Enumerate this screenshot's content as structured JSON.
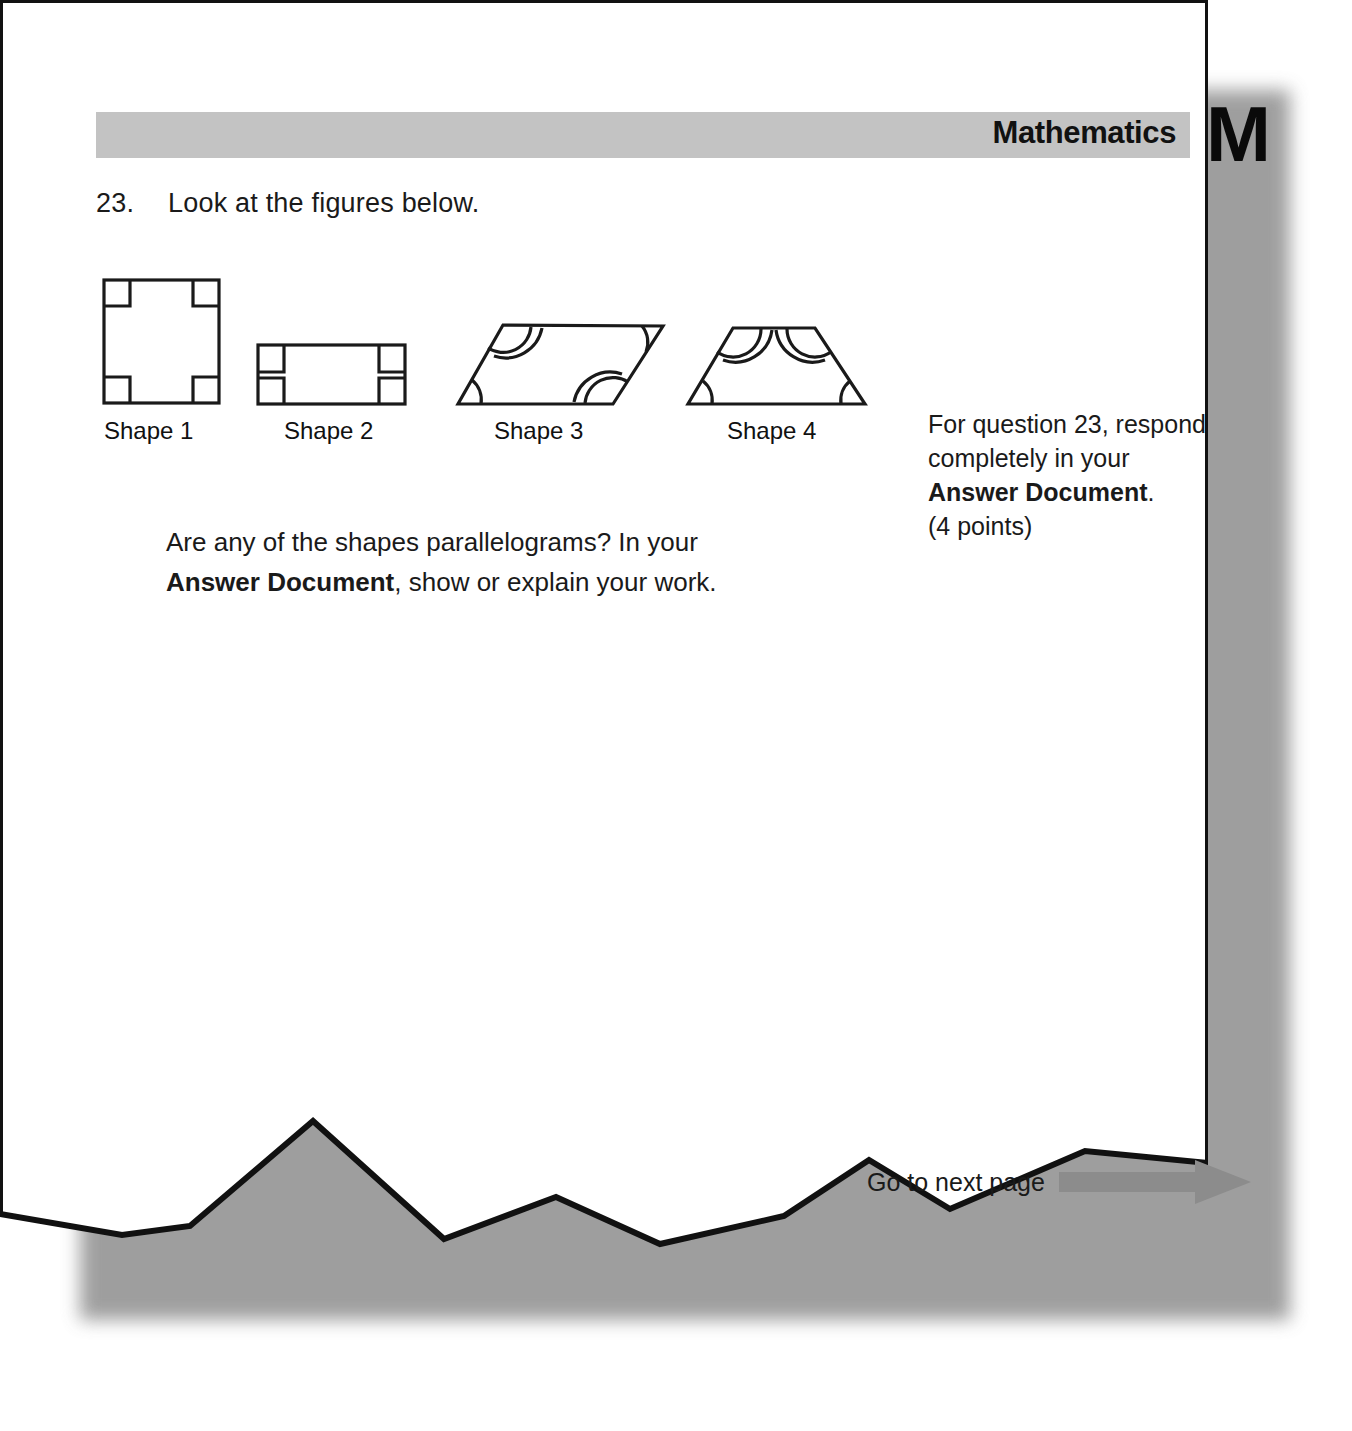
{
  "header": {
    "subject_title": "Mathematics",
    "subject_letter": "M",
    "band_color": "#c3c3c3"
  },
  "question": {
    "number": "23.",
    "stem": "Look at the figures below.",
    "prompt_line1_plain": "Are any of the shapes parallelograms? In your",
    "prompt_bold": "Answer Document",
    "prompt_line2_tail": ", show or explain your work."
  },
  "side_note": {
    "line1": "For question 23, respond",
    "line2": "completely in your",
    "bold": "Answer Document",
    "bold_tail": ".",
    "points": "(4 points)"
  },
  "figures": [
    {
      "label": "Shape 1",
      "kind": "square",
      "angle_marks": "four right angles",
      "vertices": [
        [
          104,
          288
        ],
        [
          219,
          288
        ],
        [
          219,
          411
        ],
        [
          104,
          411
        ]
      ]
    },
    {
      "label": "Shape 2",
      "kind": "rectangle",
      "angle_marks": "four right angles",
      "vertices": [
        [
          258,
          353
        ],
        [
          405,
          353
        ],
        [
          405,
          412
        ],
        [
          258,
          412
        ]
      ]
    },
    {
      "label": "Shape 3",
      "kind": "parallelogram",
      "angle_marks": "double arcs at obtuse pair, single arcs at acute pair",
      "vertices": [
        [
          503,
          333
        ],
        [
          663,
          334
        ],
        [
          613,
          412
        ],
        [
          458,
          412
        ]
      ]
    },
    {
      "label": "Shape 4",
      "kind": "trapezoid",
      "angle_marks": "double arcs at top pair, single arcs at bottom pair",
      "vertices": [
        [
          733,
          336
        ],
        [
          815,
          336
        ],
        [
          865,
          412
        ],
        [
          688,
          412
        ]
      ]
    }
  ],
  "footer": {
    "next_page_text": "Go to next page",
    "arrow_color": "#8c8c8c"
  },
  "colors": {
    "ink": "#1a1a1a",
    "paper": "#ffffff",
    "page_border": "#111111",
    "shadow": "#8e8e8e"
  }
}
